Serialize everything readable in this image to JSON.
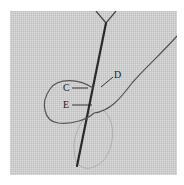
{
  "figure": {
    "labels": [
      {
        "id": "C",
        "text": "C"
      },
      {
        "id": "D",
        "text": "D"
      },
      {
        "id": "E",
        "text": "E"
      }
    ],
    "colors": {
      "fabric": "#d2d2d2",
      "needle": "#2a2a2a",
      "thread": "#555555",
      "label_text": "#222222"
    }
  }
}
